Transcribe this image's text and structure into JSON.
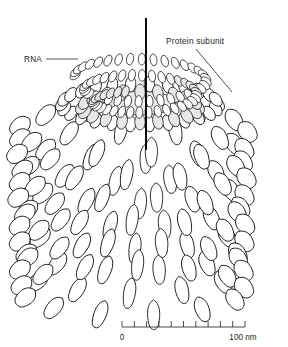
{
  "figure": {
    "background_color": "#ffffff",
    "line_color": "#121212"
  },
  "labels": {
    "rna": {
      "text": "RNA",
      "x": 24,
      "y": 62
    },
    "protein_subunit": {
      "text": "Protein subunit",
      "x": 166,
      "y": 44
    }
  },
  "scale_bar": {
    "start_label": "0",
    "end_label": "100 nm",
    "units": "nm",
    "min": 0,
    "max": 100,
    "tick_count": 11,
    "interval": 10,
    "x_start": 122,
    "x_end": 245,
    "y": 327
  },
  "structure": {
    "axis": {
      "name": "helical axis",
      "x": 146,
      "y_top": 18,
      "y_bottom": 150
    },
    "rna_coil": {
      "bead_count": 78,
      "turns": 2.2
    },
    "capsid": {
      "rows": 8,
      "subunits_per_row": 13,
      "shape": "teardrop"
    }
  }
}
